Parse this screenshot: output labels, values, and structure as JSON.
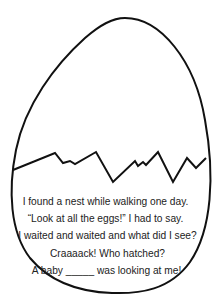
{
  "worksheet": {
    "poem": {
      "lines": [
        "I found a nest while walking one day.",
        "“Look at all the eggs!” I had to say.",
        "I waited and waited and what did I see?",
        "Craaaack! Who hatched?",
        "A baby _____ was looking at me!"
      ]
    },
    "colors": {
      "outline": "#111111",
      "text": "#222222",
      "background": "#ffffff"
    }
  }
}
